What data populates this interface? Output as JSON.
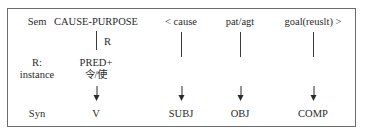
{
  "rows": {
    "sem": {
      "label": "Sem",
      "cells": [
        "CAUSE-PURPOSE",
        "< cause",
        "pat/agt",
        "goal(reuslt) >"
      ]
    },
    "relation": {
      "link_label": "R"
    },
    "instance": {
      "label_line1": "R:",
      "label_line2": "instance",
      "pred_line1": "PRED+",
      "pred_line2": "令/使"
    },
    "syn": {
      "label": "Syn",
      "cells": [
        "V",
        "SUBJ",
        "OBJ",
        "COMP"
      ]
    }
  },
  "colors": {
    "border": "#6b6b6b",
    "text": "#2a2a2a",
    "background": "#ffffff"
  }
}
